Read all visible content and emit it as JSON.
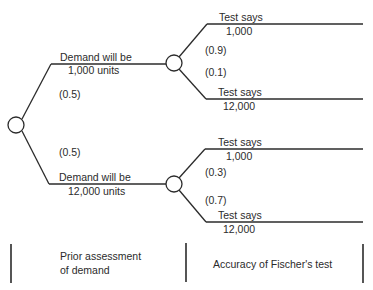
{
  "diagram": {
    "type": "decision-tree",
    "root": {
      "branches": [
        {
          "label_line1": "Demand will be",
          "label_line2": "1,000 units",
          "probability": "(0.5)",
          "test_branches": [
            {
              "label_line1": "Test says",
              "label_line2": "1,000",
              "probability": "(0.9)"
            },
            {
              "label_line1": "Test says",
              "label_line2": "12,000",
              "probability": "(0.1)"
            }
          ]
        },
        {
          "label_line1": "Demand will be",
          "label_line2": "12,000 units",
          "probability": "(0.5)",
          "test_branches": [
            {
              "label_line1": "Test says",
              "label_line2": "1,000",
              "probability": "(0.3)"
            },
            {
              "label_line1": "Test says",
              "label_line2": "12,000",
              "probability": "(0.7)"
            }
          ]
        }
      ]
    },
    "stages": [
      {
        "line1": "Prior assessment",
        "line2": "of demand"
      },
      {
        "line1": "Accuracy of Fischer's test",
        "line2": ""
      }
    ]
  }
}
